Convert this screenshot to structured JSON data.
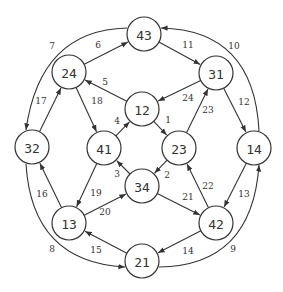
{
  "diagram": {
    "type": "directed-graph",
    "node_radius": 17,
    "colors": {
      "stroke": "#333333",
      "background": "#ffffff"
    },
    "nodes": [
      {
        "id": "43",
        "label": "43",
        "x": 144,
        "y": 34
      },
      {
        "id": "24",
        "label": "24",
        "x": 69,
        "y": 72
      },
      {
        "id": "31",
        "label": "31",
        "x": 216,
        "y": 73
      },
      {
        "id": "12",
        "label": "12",
        "x": 142,
        "y": 109
      },
      {
        "id": "41",
        "label": "41",
        "x": 104,
        "y": 148
      },
      {
        "id": "23",
        "label": "23",
        "x": 179,
        "y": 148
      },
      {
        "id": "32",
        "label": "32",
        "x": 32,
        "y": 147
      },
      {
        "id": "14",
        "label": "14",
        "x": 254,
        "y": 148
      },
      {
        "id": "34",
        "label": "34",
        "x": 142,
        "y": 186
      },
      {
        "id": "13",
        "label": "13",
        "x": 69,
        "y": 223
      },
      {
        "id": "42",
        "label": "42",
        "x": 216,
        "y": 223
      },
      {
        "id": "21",
        "label": "21",
        "x": 142,
        "y": 261
      }
    ],
    "edges": [
      {
        "from": "12",
        "to": "23",
        "label": "1",
        "lx": 168,
        "ly": 120
      },
      {
        "from": "23",
        "to": "34",
        "label": "2",
        "lx": 167,
        "ly": 175
      },
      {
        "from": "34",
        "to": "41",
        "label": "3",
        "lx": 117,
        "ly": 174
      },
      {
        "from": "41",
        "to": "12",
        "label": "4",
        "lx": 117,
        "ly": 121
      },
      {
        "from": "12",
        "to": "24",
        "label": "5",
        "lx": 105,
        "ly": 82
      },
      {
        "from": "24",
        "to": "43",
        "label": "6",
        "lx": 98,
        "ly": 45
      },
      {
        "from": "43",
        "to": "32",
        "label": "7",
        "lx": 52,
        "ly": 46,
        "curve": "M127,28 Q40,30 26,130"
      },
      {
        "from": "32",
        "to": "21",
        "label": "8",
        "lx": 52,
        "ly": 249,
        "curve": "M26,164 Q32,262 125,267"
      },
      {
        "from": "21",
        "to": "14",
        "label": "9",
        "lx": 233,
        "ly": 249,
        "curve": "M159,267 Q252,266 259,165"
      },
      {
        "from": "14",
        "to": "43",
        "label": "10",
        "lx": 234,
        "ly": 46,
        "curve": "M259,131 Q254,30 161,28"
      },
      {
        "from": "43",
        "to": "31",
        "label": "11",
        "lx": 188,
        "ly": 45
      },
      {
        "from": "31",
        "to": "14",
        "label": "12",
        "lx": 244,
        "ly": 102
      },
      {
        "from": "14",
        "to": "42",
        "label": "13",
        "lx": 244,
        "ly": 194
      },
      {
        "from": "42",
        "to": "21",
        "label": "14",
        "lx": 188,
        "ly": 251
      },
      {
        "from": "21",
        "to": "13",
        "label": "15",
        "lx": 96,
        "ly": 250
      },
      {
        "from": "13",
        "to": "32",
        "label": "16",
        "lx": 42,
        "ly": 194
      },
      {
        "from": "32",
        "to": "24",
        "label": "17",
        "lx": 41,
        "ly": 101
      },
      {
        "from": "24",
        "to": "41",
        "label": "18",
        "lx": 97,
        "ly": 101
      },
      {
        "from": "41",
        "to": "13",
        "label": "19",
        "lx": 96,
        "ly": 193
      },
      {
        "from": "13",
        "to": "34",
        "label": "20",
        "lx": 105,
        "ly": 212
      },
      {
        "from": "34",
        "to": "42",
        "label": "21",
        "lx": 188,
        "ly": 197
      },
      {
        "from": "42",
        "to": "23",
        "label": "22",
        "lx": 208,
        "ly": 186
      },
      {
        "from": "23",
        "to": "31",
        "label": "23",
        "lx": 208,
        "ly": 110
      },
      {
        "from": "31",
        "to": "12",
        "label": "24",
        "lx": 188,
        "ly": 98
      }
    ]
  }
}
